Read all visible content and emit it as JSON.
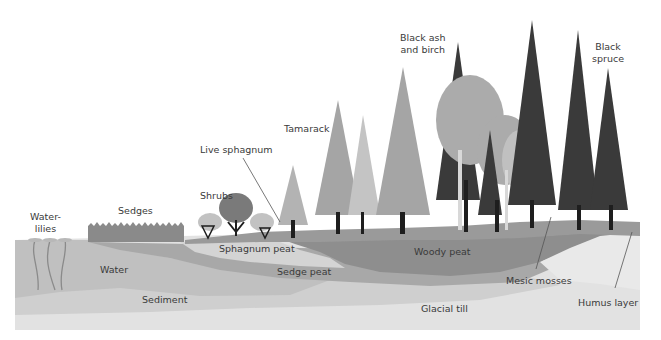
{
  "diagram": {
    "colors": {
      "background": "#ffffff",
      "glacial_till": "#e2e2e2",
      "sediment": "#cfcfcf",
      "water": "#c0c0c0",
      "sedge_peat": "#a8a8a8",
      "sphagnum_peat": "#d4d4d4",
      "woody_peat": "#8e8e8e",
      "mesic_mosses": "#e9e9e9",
      "surface": "#9a9a9a",
      "trunk": "#1e1e1e",
      "conifer_light": "#b3b3b3",
      "conifer_mid": "#9d9d9d",
      "conifer_dark": "#3a3a3a",
      "birch": "#ababab"
    },
    "labels": {
      "water_lilies_line1": "Water-",
      "water_lilies_line2": "lilies",
      "sedges": "Sedges",
      "shrubs": "Shrubs",
      "live_sphagnum": "Live sphagnum",
      "tamarack": "Tamarack",
      "black_ash_line1": "Black ash",
      "black_ash_line2": "and birch",
      "black_spruce_line1": "Black",
      "black_spruce_line2": "spruce",
      "water": "Water",
      "sediment": "Sediment",
      "sphagnum_peat": "Sphagnum peat",
      "sedge_peat": "Sedge peat",
      "woody_peat": "Woody peat",
      "glacial_till": "Glacial till",
      "mesic_mosses": "Mesic mosses",
      "humus_layer": "Humus layer"
    }
  }
}
